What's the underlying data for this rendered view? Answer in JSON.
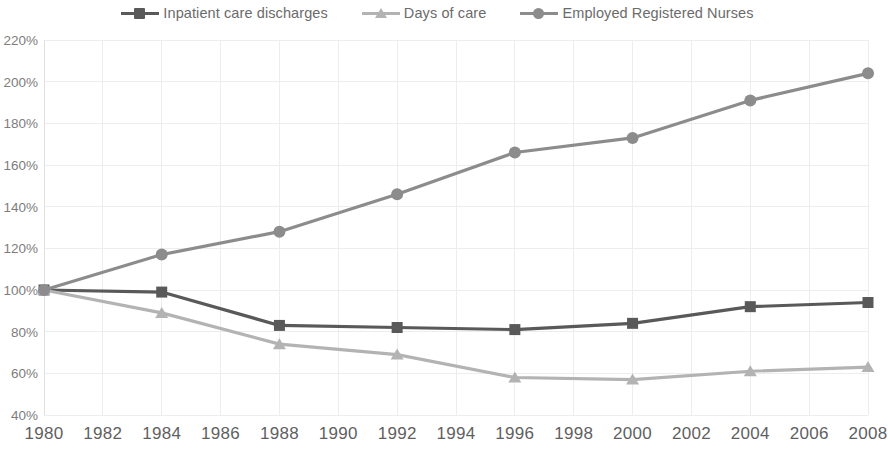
{
  "legend": {
    "position": "top-center",
    "items": [
      {
        "label": "Inpatient care discharges",
        "color": "#595959",
        "marker": "square"
      },
      {
        "label": "Days of care",
        "color": "#b3b3b3",
        "marker": "triangle"
      },
      {
        "label": "Employed Registered Nurses",
        "color": "#8c8c8c",
        "marker": "circle"
      }
    ]
  },
  "axes": {
    "y_ticks": [
      "40%",
      "60%",
      "80%",
      "100%",
      "120%",
      "140%",
      "160%",
      "180%",
      "200%",
      "220%"
    ],
    "x_ticks": [
      "1980",
      "1982",
      "1984",
      "1986",
      "1988",
      "1990",
      "1992",
      "1994",
      "1996",
      "1998",
      "2000",
      "2002",
      "2004",
      "2006",
      "2008"
    ]
  },
  "chart_data": {
    "type": "line",
    "title": "",
    "subtitle": "",
    "xlabel": "",
    "ylabel": "",
    "x": [
      1980,
      1984,
      1988,
      1992,
      1996,
      2000,
      2004,
      2008
    ],
    "categories": [
      "1980",
      "1984",
      "1988",
      "1992",
      "1996",
      "2000",
      "2004",
      "2008"
    ],
    "series": [
      {
        "name": "Inpatient care discharges",
        "color": "#595959",
        "marker": "square",
        "values": [
          100,
          99,
          83,
          82,
          81,
          84,
          92,
          94
        ]
      },
      {
        "name": "Days of care",
        "color": "#b3b3b3",
        "marker": "triangle",
        "values": [
          100,
          89,
          74,
          69,
          58,
          57,
          61,
          63
        ]
      },
      {
        "name": "Employed Registered Nurses",
        "color": "#8c8c8c",
        "marker": "circle",
        "values": [
          100,
          117,
          128,
          146,
          166,
          173,
          191,
          204
        ]
      }
    ],
    "xlim": [
      1980,
      2008
    ],
    "ylim": [
      40,
      220
    ],
    "ytick_step": 20,
    "xtick_step": 2,
    "yunit": "%",
    "grid": true,
    "grid_color": "#ededed",
    "legend_position": "top-center"
  }
}
